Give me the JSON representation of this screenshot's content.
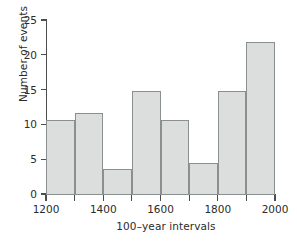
{
  "chart_data": {
    "type": "bar",
    "title": "",
    "subtitle": "",
    "xlabel": "100–year intervals",
    "ylabel": "Number of events",
    "categories": [
      "1200–1300",
      "1300–1400",
      "1400–1500",
      "1500–1600",
      "1600–1700",
      "1700–1800",
      "1800–1900",
      "1900–2000"
    ],
    "bin_edges": [
      1200,
      1300,
      1400,
      1500,
      1600,
      1700,
      1800,
      1900,
      2000
    ],
    "values": [
      10.8,
      11.8,
      3.7,
      15,
      10.8,
      4.6,
      15,
      22
    ],
    "bin_width": 100,
    "xlim": [
      1200,
      2000
    ],
    "ylim": [
      0,
      25
    ],
    "x_tick_labels": [
      "1200",
      "1400",
      "1600",
      "1800",
      "2000"
    ],
    "x_tick_values": [
      1200,
      1400,
      1600,
      1800,
      2000
    ],
    "x_minor_ticks": [
      1300,
      1500,
      1700,
      1900
    ],
    "y_tick_labels": [
      "0",
      "5",
      "10",
      "15",
      "20",
      "25"
    ],
    "y_tick_values": [
      0,
      5,
      10,
      15,
      20,
      25
    ],
    "grid": false,
    "legend": null,
    "legend_position": "none",
    "annotations": [],
    "colors": {
      "bar_fill": "#dcdedd",
      "bar_edge": "#8a8f90",
      "axis": "#4d4d4d",
      "text": "#2b2b2b",
      "background": "#ffffff"
    }
  }
}
